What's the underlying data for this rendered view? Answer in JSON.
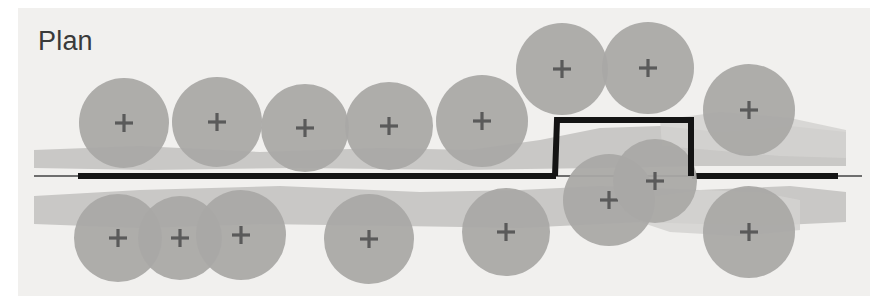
{
  "figure": {
    "title": "Plan",
    "kind": "engineering-plan-view",
    "width": 885,
    "height": 302,
    "background_color": "#ffffff",
    "panel_color": "#f1f0ee",
    "panel": {
      "x": 18,
      "y": 8,
      "width": 852,
      "height": 288
    }
  },
  "colors": {
    "circle_fill": "#a9a8a6",
    "circle_fill_light": "#b4b3b1",
    "band_fill": "#c9c8c6",
    "band_fill_soft": "#d3d2d0",
    "marker": "#5a5a5a",
    "baseline_thick": "#141414",
    "baseline_thin": "#6e6e6e",
    "step_line": "#141414",
    "label": "#3a3a3a"
  },
  "baseline": {
    "name": "ground-baseline",
    "y": 176,
    "thin_x1": 34,
    "thin_x2": 862,
    "thin_width": 2,
    "thick_segments": [
      {
        "x1": 78,
        "x2": 556,
        "width": 6
      },
      {
        "x1": 692,
        "x2": 838,
        "width": 6
      }
    ]
  },
  "step": {
    "name": "raised-step-outline",
    "left_x": 557,
    "right_x": 691,
    "top_y": 120,
    "bottom_y": 176,
    "stroke_width": 6
  },
  "bands": [
    {
      "name": "upper-strata-band",
      "points": "34,150 140,146 260,152 380,148 470,150 540,140 600,128 660,126 720,132 790,126 846,132 846,166 700,166 600,168 460,170 300,168 150,170 34,168"
    },
    {
      "name": "lower-strata-band",
      "points": "34,196 140,190 280,186 420,192 520,190 600,186 700,190 790,186 846,192 846,222 760,226 640,222 520,228 400,226 260,224 140,228 34,224"
    },
    {
      "name": "upper-right-lobe",
      "points": "660,120 720,112 790,118 846,130 846,158 780,156 710,150 662,146"
    },
    {
      "name": "lower-right-lobe",
      "points": "640,198 700,190 760,192 800,200 800,230 740,236 670,232 640,222"
    }
  ],
  "circles_upper": [
    {
      "name": "plan-circle-u1",
      "cx": 124,
      "cy": 123,
      "r": 45
    },
    {
      "name": "plan-circle-u2",
      "cx": 217,
      "cy": 122,
      "r": 45
    },
    {
      "name": "plan-circle-u3",
      "cx": 305,
      "cy": 128,
      "r": 44
    },
    {
      "name": "plan-circle-u4",
      "cx": 389,
      "cy": 126,
      "r": 44
    },
    {
      "name": "plan-circle-u5",
      "cx": 482,
      "cy": 121,
      "r": 46
    },
    {
      "name": "plan-circle-u6",
      "cx": 562,
      "cy": 69,
      "r": 46
    },
    {
      "name": "plan-circle-u7",
      "cx": 648,
      "cy": 68,
      "r": 46
    },
    {
      "name": "plan-circle-u8",
      "cx": 749,
      "cy": 110,
      "r": 46
    }
  ],
  "circles_lower": [
    {
      "name": "plan-circle-l1",
      "cx": 118,
      "cy": 238,
      "r": 44
    },
    {
      "name": "plan-circle-l2",
      "cx": 180,
      "cy": 238,
      "r": 42
    },
    {
      "name": "plan-circle-l3",
      "cx": 241,
      "cy": 235,
      "r": 45
    },
    {
      "name": "plan-circle-l4",
      "cx": 369,
      "cy": 239,
      "r": 45
    },
    {
      "name": "plan-circle-l5",
      "cx": 506,
      "cy": 232,
      "r": 44
    },
    {
      "name": "plan-circle-l6",
      "cx": 609,
      "cy": 200,
      "r": 46
    },
    {
      "name": "plan-circle-l7",
      "cx": 655,
      "cy": 181,
      "r": 42
    },
    {
      "name": "plan-circle-l8",
      "cx": 749,
      "cy": 232,
      "r": 46
    }
  ],
  "marker": {
    "name": "center-cross-marker",
    "arm": 9,
    "stroke_width": 3.2
  }
}
